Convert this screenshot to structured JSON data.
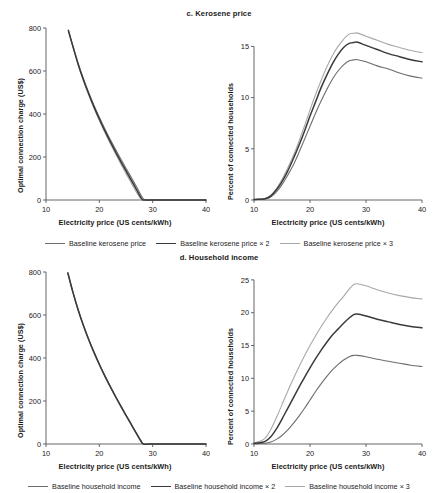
{
  "figure": {
    "width": 438,
    "height": 493,
    "background": "#ffffff"
  },
  "colors": {
    "series1": "#6d6d6d",
    "series2": "#3a3a3a",
    "series3": "#a8a8a8",
    "axis": "#555555",
    "text": "#1b1b1b"
  },
  "panels": [
    {
      "id": "c",
      "title": "c. Kerosene price",
      "legend": [
        {
          "label": "Baseline kerosene price",
          "color": "#6d6d6d"
        },
        {
          "label": "Baseline kerosene price × 2",
          "color": "#3a3a3a"
        },
        {
          "label": "Baseline kerosene price × 3",
          "color": "#a8a8a8"
        }
      ]
    },
    {
      "id": "d",
      "title": "d. Household income",
      "legend": [
        {
          "label": "Baseline household income",
          "color": "#6d6d6d"
        },
        {
          "label": "Baseline household income × 2",
          "color": "#3a3a3a"
        },
        {
          "label": "Baseline household income × 3",
          "color": "#a8a8a8"
        }
      ]
    }
  ],
  "chart_data": [
    {
      "id": "c-left",
      "type": "line",
      "title": "c. Kerosene price",
      "xlabel": "Electricity price (US cents/kWh)",
      "ylabel": "Optimal connection charge (US$)",
      "xlim": [
        10,
        40
      ],
      "ylim": [
        0,
        800
      ],
      "xticks": [
        10,
        20,
        30,
        40
      ],
      "yticks": [
        0,
        200,
        400,
        600,
        800
      ],
      "grid": false,
      "legend_position": "below",
      "x": [
        14.2,
        15,
        16,
        17,
        18,
        19,
        20,
        21,
        22,
        23,
        24,
        25,
        26,
        27,
        28,
        28.6,
        30,
        32,
        34,
        36,
        38,
        40
      ],
      "series": [
        {
          "name": "Baseline kerosene price",
          "color": "#6d6d6d",
          "values": [
            790,
            720,
            638,
            565,
            500,
            440,
            385,
            333,
            284,
            237,
            192,
            148,
            104,
            60,
            14,
            0,
            0,
            0,
            0,
            0,
            0,
            0
          ]
        },
        {
          "name": "Baseline kerosene price × 2",
          "color": "#3a3a3a",
          "values": [
            788,
            718,
            634,
            560,
            494,
            433,
            377,
            324,
            274,
            226,
            180,
            135,
            91,
            47,
            4,
            0,
            0,
            0,
            0,
            0,
            0,
            0
          ]
        },
        {
          "name": "Baseline kerosene price × 3",
          "color": "#a8a8a8",
          "values": [
            786,
            716,
            631,
            556,
            489,
            427,
            370,
            316,
            265,
            216,
            169,
            123,
            78,
            34,
            0,
            0,
            0,
            0,
            0,
            0,
            0,
            0
          ]
        }
      ]
    },
    {
      "id": "c-right",
      "type": "line",
      "title": "c. Kerosene price",
      "xlabel": "Electricity price (US cents/kWh)",
      "ylabel": "Percent of connected households",
      "xlim": [
        10,
        40
      ],
      "ylim": [
        0,
        16.8
      ],
      "xticks": [
        10,
        20,
        30,
        40
      ],
      "yticks": [
        0,
        5,
        10,
        15
      ],
      "grid": false,
      "legend_position": "below",
      "x": [
        10,
        11,
        12,
        13,
        14,
        15,
        16,
        17,
        18,
        19,
        20,
        21,
        22,
        23,
        24,
        25,
        26,
        27,
        28,
        28.5,
        30,
        32,
        34,
        36,
        38,
        40
      ],
      "series": [
        {
          "name": "Baseline kerosene price",
          "color": "#6d6d6d",
          "values": [
            0.05,
            0.07,
            0.1,
            0.3,
            0.8,
            1.5,
            2.4,
            3.4,
            4.6,
            5.9,
            7.2,
            8.5,
            9.7,
            10.8,
            11.8,
            12.6,
            13.2,
            13.6,
            13.7,
            13.7,
            13.5,
            13.1,
            12.8,
            12.4,
            12.1,
            11.9
          ]
        },
        {
          "name": "Baseline kerosene price × 2",
          "color": "#3a3a3a",
          "values": [
            0.05,
            0.08,
            0.12,
            0.4,
            1.0,
            1.8,
            2.8,
            4.0,
            5.3,
            6.7,
            8.2,
            9.6,
            11.0,
            12.2,
            13.3,
            14.2,
            14.9,
            15.3,
            15.4,
            15.4,
            15.1,
            14.7,
            14.3,
            14.0,
            13.7,
            13.5
          ]
        },
        {
          "name": "Baseline kerosene price × 3",
          "color": "#a8a8a8",
          "values": [
            0.05,
            0.09,
            0.14,
            0.45,
            1.1,
            2.0,
            3.1,
            4.3,
            5.7,
            7.2,
            8.8,
            10.3,
            11.7,
            13.0,
            14.1,
            15.0,
            15.7,
            16.2,
            16.3,
            16.3,
            16.0,
            15.6,
            15.2,
            14.9,
            14.6,
            14.4
          ]
        }
      ]
    },
    {
      "id": "d-left",
      "type": "line",
      "title": "d. Household income",
      "xlabel": "Electricity price (US cents/kWh)",
      "ylabel": "Optimal connection charge (US$)",
      "xlim": [
        10,
        40
      ],
      "ylim": [
        0,
        800
      ],
      "xticks": [
        10,
        20,
        30,
        40
      ],
      "yticks": [
        0,
        200,
        400,
        600,
        800
      ],
      "grid": false,
      "legend_position": "below",
      "x": [
        14.1,
        15,
        16,
        17,
        18,
        19,
        20,
        21,
        22,
        23,
        24,
        25,
        26,
        27,
        27.8,
        28.3,
        30,
        32,
        34,
        36,
        38,
        40
      ],
      "series": [
        {
          "name": "Baseline household income",
          "color": "#6d6d6d",
          "values": [
            797,
            712,
            628,
            554,
            488,
            428,
            372,
            320,
            271,
            224,
            179,
            135,
            92,
            49,
            16,
            0,
            0,
            0,
            0,
            0,
            0,
            0
          ]
        },
        {
          "name": "Baseline household income × 2",
          "color": "#3a3a3a",
          "values": [
            795,
            710,
            626,
            552,
            486,
            426,
            370,
            318,
            269,
            222,
            177,
            133,
            90,
            47,
            14,
            0,
            0,
            0,
            0,
            0,
            0,
            0
          ]
        },
        {
          "name": "Baseline household income × 3",
          "color": "#a8a8a8",
          "values": [
            793,
            708,
            624,
            550,
            484,
            424,
            368,
            316,
            267,
            220,
            175,
            131,
            88,
            45,
            12,
            0,
            0,
            0,
            0,
            0,
            0,
            0
          ]
        }
      ]
    },
    {
      "id": "d-right",
      "type": "line",
      "title": "d. Household income",
      "xlabel": "Electricity price (US cents/kWh)",
      "ylabel": "Percent of connected households",
      "xlim": [
        10,
        40
      ],
      "ylim": [
        0,
        26.2
      ],
      "xticks": [
        10,
        20,
        30,
        40
      ],
      "yticks": [
        0,
        5,
        10,
        15,
        20,
        25
      ],
      "grid": false,
      "legend_position": "below",
      "x": [
        10,
        11,
        12,
        13,
        14,
        15,
        16,
        17,
        18,
        19,
        20,
        21,
        22,
        23,
        24,
        25,
        26,
        27,
        27.8,
        28.4,
        30,
        32,
        34,
        36,
        38,
        40
      ],
      "series": [
        {
          "name": "Baseline household income",
          "color": "#6d6d6d",
          "values": [
            0.05,
            0.07,
            0.1,
            0.3,
            0.7,
            1.3,
            2.1,
            3.1,
            4.2,
            5.4,
            6.7,
            8.0,
            9.2,
            10.3,
            11.3,
            12.1,
            12.8,
            13.3,
            13.5,
            13.5,
            13.3,
            12.9,
            12.6,
            12.3,
            12.0,
            11.8
          ]
        },
        {
          "name": "Baseline household income × 2",
          "color": "#3a3a3a",
          "values": [
            0.1,
            0.2,
            0.4,
            1.1,
            2.3,
            3.8,
            5.4,
            7.0,
            8.6,
            10.1,
            11.6,
            13.0,
            14.3,
            15.5,
            16.6,
            17.5,
            18.4,
            19.2,
            19.7,
            19.8,
            19.5,
            19.0,
            18.6,
            18.2,
            17.9,
            17.7
          ]
        },
        {
          "name": "Baseline household income × 3",
          "color": "#a8a8a8",
          "values": [
            0.15,
            0.4,
            0.9,
            2.2,
            4.0,
            6.0,
            8.0,
            9.9,
            11.7,
            13.4,
            15.0,
            16.5,
            17.9,
            19.2,
            20.4,
            21.5,
            22.5,
            23.6,
            24.3,
            24.4,
            24.1,
            23.5,
            23.0,
            22.6,
            22.3,
            22.1
          ]
        }
      ]
    }
  ]
}
